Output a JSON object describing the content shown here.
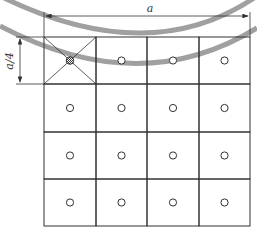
{
  "diagram": {
    "title": "",
    "labels": {
      "width_dimension": "a",
      "height_dimension": "a/4"
    },
    "grid": {
      "rows": 4,
      "cols": 4,
      "crossed_cell": {
        "row": 0,
        "col": 0
      },
      "crossed_cell_marker": "crosshatched-circle",
      "other_cell_marker": "hollow-circle"
    },
    "colors": {
      "line": "#333333",
      "arc": "#9a9a9a",
      "background": "#ffffff"
    }
  }
}
